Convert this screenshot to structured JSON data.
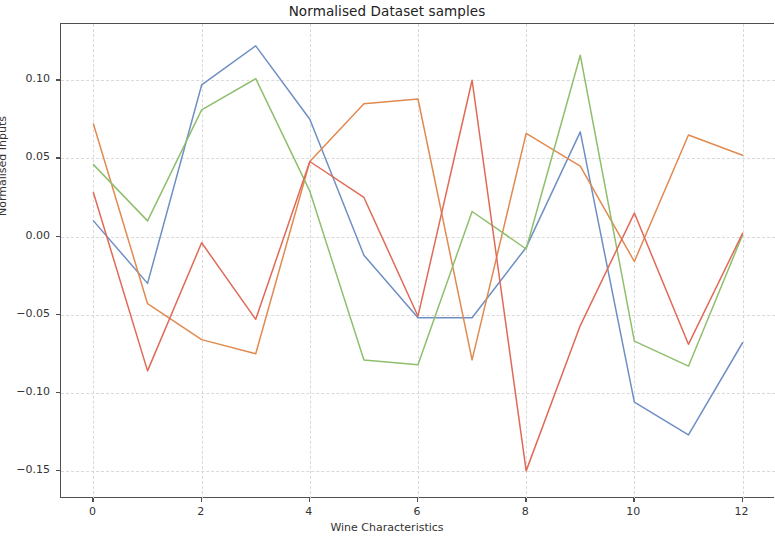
{
  "chart_data": {
    "type": "line",
    "title": "Normalised Dataset samples",
    "xlabel": "Wine Characteristics",
    "ylabel": "Normalised Inputs",
    "x": [
      0,
      1,
      2,
      3,
      4,
      5,
      6,
      7,
      8,
      9,
      10,
      11,
      12
    ],
    "xlim": [
      -0.6,
      12.6
    ],
    "ylim": [
      -0.168,
      0.136
    ],
    "xticks": [
      0,
      2,
      4,
      6,
      8,
      10,
      12
    ],
    "xtick_labels": [
      "0",
      "2",
      "4",
      "6",
      "8",
      "10",
      "12"
    ],
    "yticks": [
      0.1,
      0.05,
      0.0,
      -0.05,
      -0.1,
      -0.15
    ],
    "ytick_labels": [
      "0.10",
      "0.05",
      "0.00",
      "−0.05",
      "−0.10",
      "−0.15"
    ],
    "grid": true,
    "grid_style": "dashed",
    "legend": null,
    "series": [
      {
        "name": "sample-1",
        "color": "#6f8fc4",
        "values": [
          0.01,
          -0.03,
          0.097,
          0.122,
          0.075,
          -0.012,
          -0.052,
          -0.052,
          -0.007,
          0.067,
          -0.106,
          -0.127,
          -0.068
        ]
      },
      {
        "name": "sample-2",
        "color": "#e08a50",
        "values": [
          0.072,
          -0.043,
          -0.066,
          -0.075,
          0.048,
          0.085,
          0.088,
          -0.079,
          0.066,
          0.045,
          -0.016,
          0.065,
          0.052
        ]
      },
      {
        "name": "sample-3",
        "color": "#8fbf6d",
        "values": [
          0.046,
          0.01,
          0.081,
          0.101,
          0.029,
          -0.079,
          -0.082,
          0.016,
          -0.008,
          0.116,
          -0.067,
          -0.083,
          0.001
        ]
      },
      {
        "name": "sample-4",
        "color": "#e06a57",
        "values": [
          0.028,
          -0.086,
          -0.004,
          -0.053,
          0.048,
          0.025,
          -0.051,
          0.1,
          -0.15,
          -0.057,
          0.015,
          -0.069,
          0.002
        ]
      }
    ]
  },
  "colors": {
    "background": "#ffffff",
    "axis": "#4f4f4f",
    "grid": "#d9d9d9",
    "text": "#333333"
  }
}
